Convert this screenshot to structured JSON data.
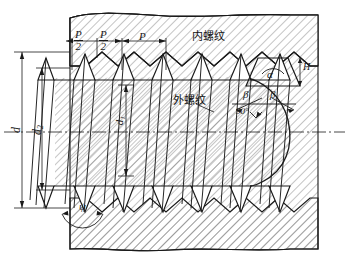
{
  "drawing": {
    "title": "Screw thread engagement cross-section",
    "ink": "#1a1a1a",
    "hatch": "#555555",
    "background": "#ffffff"
  },
  "labels": {
    "internal_thread": "内螺纹",
    "external_thread": "外螺纹",
    "pitch_half_1_num": "P",
    "pitch_half_1_den": "2",
    "pitch_half_2_num": "P",
    "pitch_half_2_den": "2",
    "pitch_full": "P",
    "major_diameter": "d",
    "pitch_diameter_num": "d",
    "pitch_diameter_sub": "2",
    "minor_diameter_num": "d",
    "minor_diameter_sub": "1",
    "thread_height": "H",
    "thread_angle": "α",
    "flank_angle_left": "β",
    "flank_angle_right": "β",
    "right_angle": "90°",
    "helix_angle": "ψ"
  }
}
